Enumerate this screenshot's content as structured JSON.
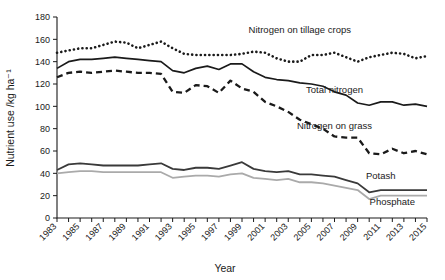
{
  "chart_data": {
    "type": "line",
    "title": "",
    "xlabel": "Year",
    "ylabel": "Nutrient use /kg ha⁻¹",
    "xlim": [
      1983,
      2015
    ],
    "ylim": [
      0,
      180
    ],
    "ytick_step": 20,
    "yticks": [
      "0",
      "20",
      "40",
      "60",
      "80",
      "100",
      "120",
      "140",
      "160",
      "180"
    ],
    "xticks": [
      "1983",
      "1985",
      "1987",
      "1989",
      "1991",
      "1993",
      "1995",
      "1997",
      "1999",
      "2001",
      "2003",
      "2005",
      "2007",
      "2009",
      "2011",
      "2013",
      "2015"
    ],
    "grid": false,
    "legend_position": "inline-annotations",
    "x": [
      1983,
      1984,
      1985,
      1986,
      1987,
      1988,
      1989,
      1990,
      1991,
      1992,
      1993,
      1994,
      1995,
      1996,
      1997,
      1998,
      1999,
      2000,
      2001,
      2002,
      2003,
      2004,
      2005,
      2006,
      2007,
      2008,
      2009,
      2010,
      2011,
      2012,
      2013,
      2014,
      2015
    ],
    "series": [
      {
        "name": "Nitrogen on tillage crops",
        "style": "dotted",
        "color": "#1a1a1a",
        "label_x": 2004,
        "label_y": 166,
        "values": [
          148,
          150,
          152,
          152,
          155,
          158,
          157,
          152,
          155,
          158,
          152,
          147,
          146,
          146,
          146,
          146,
          147,
          149,
          148,
          143,
          140,
          140,
          146,
          146,
          148,
          144,
          140,
          144,
          146,
          148,
          147,
          143,
          145
        ]
      },
      {
        "name": "Total nitrogen",
        "style": "solid",
        "color": "#1a1a1a",
        "label_x": 2007,
        "label_y": 112,
        "values": [
          134,
          140,
          142,
          142,
          143,
          144,
          143,
          142,
          141,
          140,
          132,
          130,
          134,
          136,
          133,
          138,
          138,
          131,
          126,
          124,
          123,
          121,
          120,
          118,
          113,
          110,
          103,
          101,
          104,
          104,
          101,
          102,
          100
        ]
      },
      {
        "name": "Nitrogen on grass",
        "style": "dashed",
        "color": "#1a1a1a",
        "label_x": 2007,
        "label_y": 80,
        "values": [
          126,
          130,
          131,
          130,
          131,
          132,
          131,
          130,
          130,
          129,
          113,
          112,
          119,
          118,
          112,
          123,
          116,
          113,
          104,
          100,
          95,
          88,
          84,
          80,
          73,
          72,
          72,
          58,
          57,
          62,
          58,
          60,
          57
        ]
      },
      {
        "name": "Potash",
        "style": "solid-thick",
        "color": "#3a3a3a",
        "label_x": 2011,
        "label_y": 35,
        "values": [
          43,
          48,
          49,
          48,
          47,
          47,
          47,
          47,
          48,
          49,
          44,
          43,
          45,
          45,
          44,
          47,
          50,
          44,
          42,
          41,
          42,
          39,
          39,
          38,
          37,
          34,
          31,
          23,
          25,
          25,
          25,
          25,
          25
        ]
      },
      {
        "name": "Phosphate",
        "style": "solid-gray",
        "color": "#aaaaaa",
        "label_x": 2012,
        "label_y": 12,
        "values": [
          40,
          41,
          42,
          42,
          41,
          41,
          41,
          41,
          41,
          41,
          36,
          37,
          38,
          38,
          37,
          39,
          40,
          36,
          35,
          34,
          35,
          32,
          32,
          31,
          29,
          27,
          25,
          17,
          20,
          20,
          20,
          20,
          20
        ]
      }
    ]
  }
}
